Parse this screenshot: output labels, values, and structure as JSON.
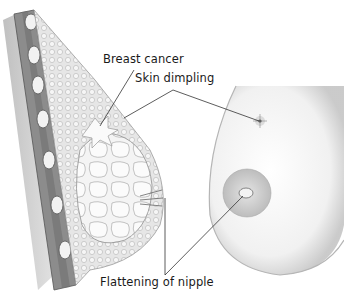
{
  "figure": {
    "panels": [
      "cross-section",
      "external view"
    ]
  },
  "labels": {
    "breast_cancer": "Breast cancer",
    "skin_dimpling": "Skin dimpling",
    "flattening_of_nipple": "Flattening of nipple"
  },
  "colors": {
    "background": "#ffffff",
    "muscle": "#8a8a8a",
    "muscle_dark": "#5a5a5a",
    "fat_tissue": "#d9d9d9",
    "skin_outline": "#9a9a9a",
    "leader_line": "#333333",
    "text": "#1a1a1a"
  }
}
